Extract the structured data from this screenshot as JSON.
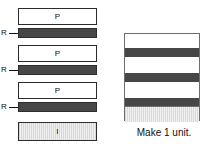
{
  "diagram": {
    "exploded_view": {
      "name": "exploded-layer-stack",
      "layers": [
        {
          "id": "p1",
          "label": "P",
          "type": "plain",
          "callout": null,
          "x": 18,
          "y": 8,
          "w": 79,
          "h": 17
        },
        {
          "id": "r1",
          "label": "",
          "type": "reinforce",
          "callout": "R",
          "x": 18,
          "y": 28,
          "w": 79,
          "h": 10
        },
        {
          "id": "p2",
          "label": "P",
          "type": "plain",
          "callout": null,
          "x": 18,
          "y": 45,
          "w": 79,
          "h": 17
        },
        {
          "id": "r2",
          "label": "",
          "type": "reinforce",
          "callout": "R",
          "x": 18,
          "y": 65,
          "w": 79,
          "h": 10
        },
        {
          "id": "p3",
          "label": "P",
          "type": "plain",
          "callout": null,
          "x": 18,
          "y": 82,
          "w": 79,
          "h": 17
        },
        {
          "id": "r3",
          "label": "",
          "type": "reinforce",
          "callout": "R",
          "x": 18,
          "y": 102,
          "w": 79,
          "h": 10
        },
        {
          "id": "i1",
          "label": "I",
          "type": "insulator",
          "callout": null,
          "x": 18,
          "y": 122,
          "w": 79,
          "h": 19
        }
      ],
      "callout_labels": [
        "R",
        "R",
        "R"
      ]
    },
    "assembled_view": {
      "name": "assembled-unit-stack",
      "bands": [
        {
          "id": "band-p1",
          "type": "plain",
          "top": 0,
          "height": 14
        },
        {
          "id": "band-r1",
          "type": "reinforce",
          "top": 14,
          "height": 9
        },
        {
          "id": "band-p2",
          "type": "plain",
          "top": 23,
          "height": 16
        },
        {
          "id": "band-r2",
          "type": "reinforce",
          "top": 39,
          "height": 9
        },
        {
          "id": "band-p3",
          "type": "plain",
          "top": 48,
          "height": 16
        },
        {
          "id": "band-r3",
          "type": "reinforce",
          "top": 64,
          "height": 8
        },
        {
          "id": "band-i1",
          "type": "insulator",
          "top": 72,
          "height": 16
        }
      ]
    },
    "caption": "Make 1 unit.",
    "colors": {
      "plain_fill": "#ffffff",
      "reinforce_fill": "#474747",
      "insulator_fill": "#e4e4e4",
      "outline": "#2b2b2b",
      "assembled_outline": "#6d6d6d",
      "text": "#111111"
    }
  }
}
